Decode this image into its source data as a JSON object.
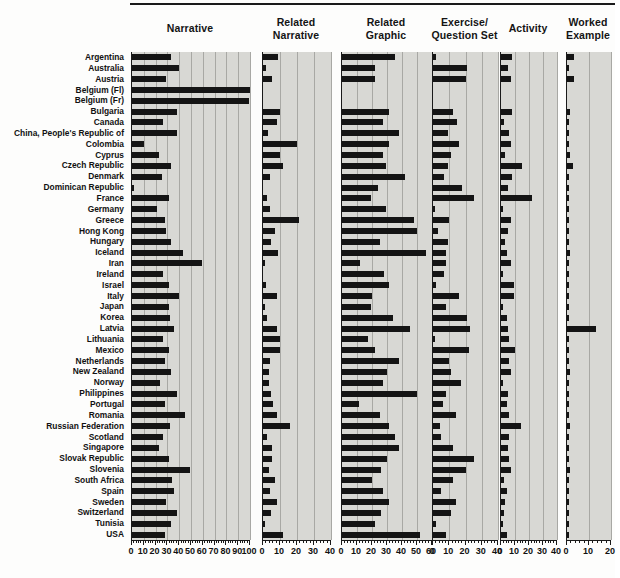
{
  "figure": {
    "title": "",
    "background_color": "#fdfdfc",
    "panel_color": "#d8d8d4",
    "bar_color": "#141414"
  },
  "chart_data": {
    "type": "bar",
    "orientation": "horizontal",
    "title": "",
    "xlabel": "",
    "ylabel": "",
    "grid": true,
    "legend": "none",
    "categories": [
      "Argentina",
      "Australia",
      "Austria",
      "Belgium (Fl)",
      "Belgium (Fr)",
      "Bulgaria",
      "Canada",
      "China, People's Republic of",
      "Colombia",
      "Cyprus",
      "Czech Republic",
      "Denmark",
      "Dominican Republic",
      "France",
      "Germany",
      "Greece",
      "Hong Kong",
      "Hungary",
      "Iceland",
      "Iran",
      "Ireland",
      "Israel",
      "Italy",
      "Japan",
      "Korea",
      "Latvia",
      "Lithuania",
      "Mexico",
      "Netherlands",
      "New Zealand",
      "Norway",
      "Philippines",
      "Portugal",
      "Romania",
      "Russian Federation",
      "Scotland",
      "Singapore",
      "Slovak Republic",
      "Slovenia",
      "South Africa",
      "Spain",
      "Sweden",
      "Switzerland",
      "Tunisia",
      "USA"
    ],
    "panels": [
      {
        "name": "Narrative",
        "header_lines": [
          "Narrative"
        ],
        "xlim": [
          0,
          100
        ],
        "ticks": [
          0,
          10,
          20,
          30,
          40,
          50,
          60,
          70,
          80,
          90,
          100
        ],
        "tick_labels": [
          "0",
          "10",
          "20",
          "30",
          "40",
          "50",
          "60",
          "70",
          "80",
          "90",
          "100"
        ],
        "minor_step": 2,
        "values": [
          33,
          40,
          29,
          100,
          99,
          38,
          26,
          38,
          10,
          23,
          33,
          25,
          2,
          31,
          21,
          28,
          29,
          33,
          43,
          59,
          26,
          31,
          40,
          31,
          32,
          36,
          26,
          31,
          28,
          33,
          24,
          38,
          28,
          45,
          32,
          26,
          23,
          31,
          49,
          34,
          36,
          29,
          38,
          33,
          28
        ]
      },
      {
        "name": "Related Narrative",
        "header_lines": [
          "Related",
          "Narrative"
        ],
        "xlim": [
          0,
          40
        ],
        "ticks": [
          0,
          10,
          20,
          30,
          40
        ],
        "tick_labels": [
          "0",
          "10",
          "20",
          "30",
          "40"
        ],
        "minor_step": 2,
        "values": [
          9,
          1.5,
          5,
          0,
          0,
          10,
          8,
          3,
          20,
          10,
          12,
          4,
          0,
          2.5,
          4,
          21,
          7,
          4.5,
          9,
          0.8,
          0,
          1.5,
          8,
          0.6,
          2.5,
          8,
          10,
          10,
          4,
          3.5,
          3.5,
          4.5,
          6,
          8,
          16,
          2.5,
          5.5,
          5,
          3.5,
          7,
          4,
          8,
          4.5,
          0.8,
          12
        ]
      },
      {
        "name": "Related Graphic",
        "header_lines": [
          "Related",
          "Graphic"
        ],
        "xlim": [
          0,
          60
        ],
        "ticks": [
          0,
          10,
          20,
          30,
          40,
          50,
          60
        ],
        "tick_labels": [
          "0",
          "10",
          "20",
          "30",
          "40",
          "50",
          "60"
        ],
        "minor_step": 2,
        "values": [
          35,
          22,
          22,
          0,
          0,
          31,
          27,
          38,
          31,
          27,
          29,
          42,
          24,
          19,
          29,
          48,
          50,
          25,
          56,
          12,
          28,
          31,
          20,
          19,
          34,
          45,
          17,
          22,
          38,
          30,
          27,
          50,
          11,
          25,
          31,
          35,
          38,
          30,
          26,
          20,
          27,
          31,
          26,
          22,
          52
        ]
      },
      {
        "name": "Exercise/Question Set",
        "header_lines": [
          "Exercise/",
          "Question Set"
        ],
        "xlim": [
          0,
          40
        ],
        "ticks": [
          0,
          10,
          20,
          30,
          40
        ],
        "tick_labels": [
          "0",
          "10",
          "20",
          "30",
          "40"
        ],
        "minor_step": 2,
        "values": [
          2,
          21,
          20,
          0,
          0,
          12,
          15,
          9,
          16,
          11,
          9,
          7,
          18,
          25,
          1,
          10,
          3,
          9,
          8,
          8,
          7,
          2,
          16,
          8,
          21,
          23,
          1.5,
          22,
          10,
          11,
          17,
          8,
          6,
          14,
          4,
          5,
          12,
          25,
          20,
          12,
          5,
          14,
          11,
          2,
          8
        ]
      },
      {
        "name": "Activity",
        "header_lines": [
          "Activity"
        ],
        "xlim": [
          0,
          40
        ],
        "ticks": [
          0,
          10,
          20,
          30,
          40
        ],
        "tick_labels": [
          "0",
          "10",
          "20",
          "30",
          "40"
        ],
        "minor_step": 2,
        "values": [
          8,
          5,
          7,
          0,
          0,
          8,
          2,
          6,
          7,
          3,
          15,
          8,
          5,
          22,
          1,
          7,
          5,
          3,
          4,
          7,
          1,
          9,
          9,
          1.5,
          4,
          5,
          6,
          10,
          6,
          7,
          1.5,
          5,
          4,
          6,
          14,
          6,
          5,
          6,
          7,
          2,
          4,
          3,
          2,
          1.5,
          4
        ]
      },
      {
        "name": "Worked Example",
        "header_lines": [
          "Worked",
          "Example"
        ],
        "xlim": [
          0,
          20
        ],
        "ticks": [
          0,
          10,
          20
        ],
        "tick_labels": [
          "0",
          "10",
          "20"
        ],
        "minor_step": 2,
        "values": [
          3,
          0.6,
          3,
          0,
          0,
          1.2,
          0.6,
          0.8,
          0.8,
          1.2,
          2.5,
          0.6,
          0.6,
          0.6,
          0.8,
          0.6,
          0.6,
          0.6,
          1.2,
          0.6,
          0.6,
          0.6,
          0.6,
          0.6,
          0.6,
          13,
          0.8,
          0.6,
          0.6,
          1.2,
          0.6,
          0.6,
          0.6,
          0.6,
          1.2,
          0.6,
          0.6,
          0.6,
          1.2,
          0.6,
          0.6,
          0.6,
          0.8,
          0.6,
          0.6
        ]
      }
    ]
  }
}
